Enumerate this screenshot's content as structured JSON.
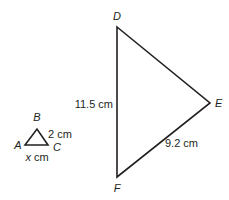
{
  "small_triangle": {
    "name": "ABC",
    "vertices": {
      "A": {
        "label": "A",
        "x": 25,
        "y": 145
      },
      "B": {
        "label": "B",
        "x": 37,
        "y": 129
      },
      "C": {
        "label": "C",
        "x": 48,
        "y": 145
      }
    },
    "sides": {
      "BC": {
        "label": "2 cm"
      },
      "AC": {
        "label_var": "x",
        "label_unit": " cm"
      }
    }
  },
  "large_triangle": {
    "name": "DEF",
    "vertices": {
      "D": {
        "label": "D",
        "x": 117,
        "y": 27
      },
      "E": {
        "label": "E",
        "x": 210,
        "y": 103
      },
      "F": {
        "label": "F",
        "x": 117,
        "y": 177
      }
    },
    "sides": {
      "DF": {
        "label": "11.5 cm"
      },
      "EF": {
        "label": "9.2 cm"
      }
    }
  },
  "colors": {
    "stroke": "#231f20",
    "text": "#231f20",
    "background": "#ffffff"
  }
}
